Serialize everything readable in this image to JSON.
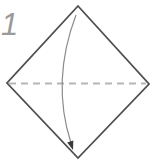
{
  "step": {
    "number": "1"
  },
  "diagram": {
    "paper_shape": "square-rotated-45",
    "fold_line_style": "dashed-valley-fold",
    "arrow_meaning": "fold-top-corner-down-to-bottom-corner"
  },
  "colors": {
    "background": "#ffffff",
    "paper_edge": "#4f4f4f",
    "fold_line": "#b5b5b5",
    "arrow_line": "#8c8c8c",
    "arrow_head": "#3a3a3a",
    "step_number": "#9a9a9a"
  }
}
